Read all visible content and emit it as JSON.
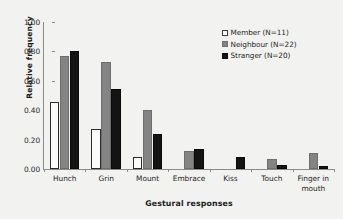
{
  "chart_data": {
    "type": "bar",
    "title": "",
    "xlabel": "Gestural responses",
    "ylabel": "Relative frequency",
    "ylim": [
      0.0,
      1.0
    ],
    "yticks": [
      "0.00",
      "0.20",
      "0.40",
      "0.60",
      "0.80",
      "1.00"
    ],
    "ytick_values": [
      0.0,
      0.2,
      0.4,
      0.6,
      0.8,
      1.0
    ],
    "grid": false,
    "legend_position": "top-right",
    "categories": [
      "Hunch",
      "Grin",
      "Mount",
      "Embrace",
      "Kiss",
      "Touch",
      "Finger in mouth"
    ],
    "series": [
      {
        "name": "Member (N=11)",
        "key": "member",
        "color": "#fbfbfa",
        "values": [
          0.455,
          0.27,
          0.08,
          0.0,
          0.0,
          0.0,
          0.0
        ]
      },
      {
        "name": "Neighbour (N=22)",
        "key": "neighbour",
        "color": "#848484",
        "values": [
          0.77,
          0.725,
          0.4,
          0.12,
          0.0,
          0.065,
          0.11
        ]
      },
      {
        "name": "Stranger (N=20)",
        "key": "stranger",
        "color": "#141414",
        "values": [
          0.8,
          0.545,
          0.24,
          0.135,
          0.08,
          0.025,
          0.02
        ]
      }
    ]
  },
  "legend": {
    "items": [
      {
        "label": "Member (N=11)",
        "key": "member"
      },
      {
        "label": "Neighbour (N=22)",
        "key": "neighbour"
      },
      {
        "label": "Stranger (N=20)",
        "key": "stranger"
      }
    ]
  }
}
